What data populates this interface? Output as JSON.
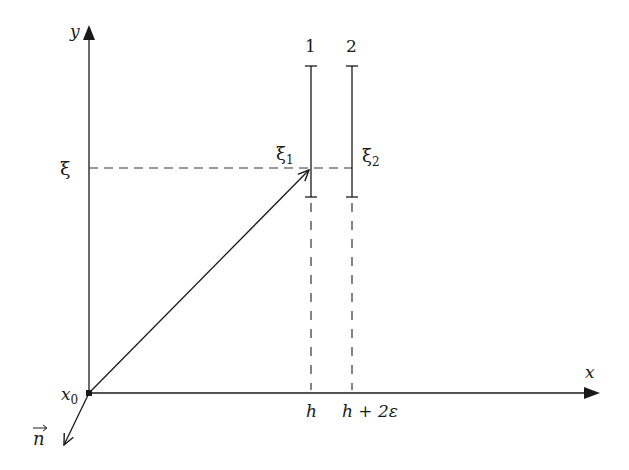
{
  "diagram": {
    "axes": {
      "x_label": "x",
      "y_label": "y",
      "origin_label": "x",
      "origin_subscript": "0"
    },
    "normal_vector": {
      "label": "n"
    },
    "horizontal_level": {
      "label": "ξ"
    },
    "bars": [
      {
        "number_label": "1",
        "xi_label": "ξ",
        "xi_subscript": "1",
        "x_label": "h"
      },
      {
        "number_label": "2",
        "xi_label": "ξ",
        "xi_subscript": "2",
        "x_label": "h + 2ε"
      }
    ],
    "colors": {
      "line": "#1a1a1a",
      "dashed": "#333333",
      "background": "#ffffff"
    }
  }
}
